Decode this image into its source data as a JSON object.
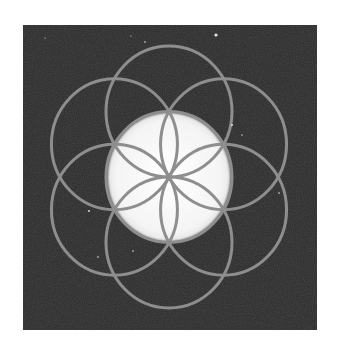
{
  "figure": {
    "colors": {
      "page_background": "#ffffff",
      "panel_background": "#2b2b2b",
      "circle_stroke": "#8e8e8e",
      "center_disc": "#f6f6f6"
    },
    "panel": {
      "x": 23,
      "y": 25,
      "width": 294,
      "height": 305
    },
    "center": {
      "x": 169,
      "y": 177
    },
    "circle_radius_x": 63,
    "circle_radius_y": 65.5,
    "circle_count": 7,
    "stroke_width": 3,
    "specks": [
      {
        "x": 216,
        "y": 35,
        "r": 1.6
      },
      {
        "x": 145,
        "y": 42,
        "r": 0.8
      },
      {
        "x": 232,
        "y": 125,
        "r": 0.9
      },
      {
        "x": 279,
        "y": 193,
        "r": 0.8
      },
      {
        "x": 89,
        "y": 211,
        "r": 0.9
      },
      {
        "x": 133,
        "y": 251,
        "r": 0.8
      },
      {
        "x": 98,
        "y": 257,
        "r": 0.8
      },
      {
        "x": 242,
        "y": 135,
        "r": 0.7
      },
      {
        "x": 45,
        "y": 38,
        "r": 0.6
      },
      {
        "x": 131,
        "y": 36,
        "r": 0.6
      }
    ]
  }
}
